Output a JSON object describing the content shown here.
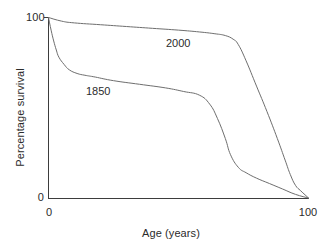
{
  "chart_data": {
    "type": "line",
    "title": "",
    "subtitle": "",
    "xlabel": "Age (years)",
    "ylabel": "Percentage survival",
    "xlim": [
      0,
      100
    ],
    "ylim": [
      0,
      100
    ],
    "xticks": [
      0,
      100
    ],
    "xtick_labels": [
      "0",
      "100"
    ],
    "yticks": [
      0,
      100
    ],
    "ytick_labels": [
      "0",
      "100"
    ],
    "grid": false,
    "legend": "inline-annotations",
    "annotations": [
      {
        "text": "2000",
        "x": 62,
        "y": 86
      },
      {
        "text": "1850",
        "x": 22,
        "y": 61
      }
    ],
    "series": [
      {
        "name": "1850",
        "label": "1850",
        "color": "#6e6e6e",
        "x": [
          0,
          1,
          2,
          3,
          4,
          6,
          8,
          11,
          14,
          18,
          25,
          35,
          45,
          52,
          58,
          62,
          65,
          68,
          70,
          73,
          76,
          80,
          85,
          90,
          95,
          100
        ],
        "values": [
          100,
          93,
          87,
          82,
          78,
          74,
          71,
          69,
          68,
          67,
          65,
          63,
          61,
          59,
          57,
          52,
          44,
          33,
          24,
          17,
          14,
          11,
          8,
          5,
          2,
          0
        ]
      },
      {
        "name": "2000",
        "label": "2000",
        "color": "#6e6e6e",
        "x": [
          0,
          5,
          10,
          20,
          30,
          40,
          50,
          58,
          64,
          68,
          71,
          73,
          76,
          80,
          84,
          88,
          91,
          93,
          95,
          97,
          100
        ],
        "values": [
          100,
          98,
          97,
          96,
          95,
          94,
          93,
          92,
          91,
          90,
          88,
          85,
          76,
          62,
          48,
          33,
          21,
          13,
          7,
          4,
          0
        ]
      }
    ]
  },
  "axes": {
    "y_top_label": "100",
    "y_bottom_label": "0",
    "x_left_label": "0",
    "x_right_label": "100",
    "x_title": "Age (years)",
    "y_title": "Percentage survival"
  },
  "labels": {
    "series_2000": "2000",
    "series_1850": "1850"
  },
  "colors": {
    "axis": "#3d3d3d",
    "curve": "#6e6e6e",
    "text": "#2b2b2b",
    "background": "#ffffff"
  }
}
